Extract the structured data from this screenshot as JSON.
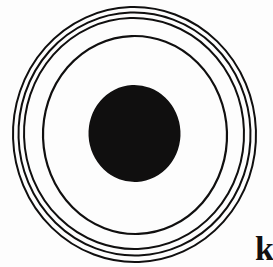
{
  "figure": {
    "name": "concentric-rings-target-diagram",
    "canvas": {
      "width": 273,
      "height": 267,
      "background_color": "#fdfdfd"
    },
    "ink_color": "#100f0f",
    "center": {
      "cx": 134,
      "cy": 133
    },
    "rings": [
      {
        "id": "ring-outer-1",
        "label": "outermost ring",
        "cx": 134.5,
        "cy": 134.5,
        "rx": 121.5,
        "ry": 127.5,
        "rotation": -2,
        "stroke_width": 2.0
      },
      {
        "id": "ring-outer-2",
        "label": "second ring",
        "cx": 134.5,
        "cy": 134.0,
        "rx": 116.0,
        "ry": 121.5,
        "rotation": -2,
        "stroke_width": 2.0
      },
      {
        "id": "ring-outer-3",
        "label": "third ring",
        "cx": 134.0,
        "cy": 133.5,
        "rx": 110.0,
        "ry": 115.5,
        "rotation": -2,
        "stroke_width": 2.0
      },
      {
        "id": "ring-inner-4",
        "label": "innermost ring",
        "cx": 135.0,
        "cy": 135.0,
        "rx": 92.0,
        "ry": 99.0,
        "rotation": -2,
        "stroke_width": 2.2
      }
    ],
    "core": {
      "id": "core-disc",
      "label": "solid black center disc",
      "cx": 134.5,
      "cy": 133.5,
      "rx": 46.0,
      "ry": 48.5,
      "rotation": -3,
      "fill_color": "#100f0f"
    },
    "corner_letter": {
      "text": "k",
      "left_px": 255,
      "top_px": 232,
      "font_size_px": 34,
      "color": "#111010"
    }
  }
}
